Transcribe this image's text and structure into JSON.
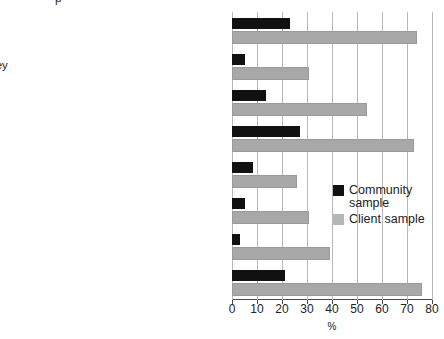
{
  "chart_data": {
    "type": "bar",
    "orientation": "horizontal",
    "title": "",
    "title_fragment": "p",
    "xlabel": "%",
    "ylabel": "",
    "xlim": [
      0,
      80
    ],
    "xticks": [
      0,
      10,
      20,
      30,
      40,
      50,
      60,
      70,
      80
    ],
    "grid": true,
    "legend_position": "center-right",
    "categories": [
      "Does not have $500 in emergency savings",
      "Had to pawn or sell something or borrow money",
      "Could not raise $2,000 in a week",
      "Does not have $50,000 worth of assets",
      "Has not spent $100 on a special treat",
      "Does not have enough to get by on",
      "Currently unemployed or looking for work",
      "Lives in a jobless household"
    ],
    "series": [
      {
        "name": "Community sample",
        "color": "#111111",
        "values": [
          23,
          5,
          13.5,
          27,
          8.5,
          5,
          3,
          21
        ]
      },
      {
        "name": "Client sample",
        "color": "#a8a8a8",
        "values": [
          73,
          30,
          53,
          72,
          25,
          30,
          38.5,
          75
        ]
      }
    ]
  },
  "legend": {
    "items": [
      {
        "label": "Community\nsample",
        "swatch": "community"
      },
      {
        "label": "Client sample",
        "swatch": "client"
      }
    ]
  },
  "axis": {
    "x_title": "%"
  }
}
